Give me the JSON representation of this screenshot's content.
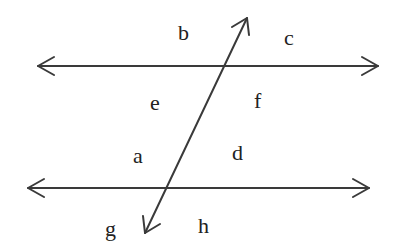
{
  "diagram": {
    "colors": {
      "line": "#3a3a3a",
      "text": "#222222",
      "background": "#ffffff"
    },
    "lines": {
      "top_parallel": {
        "x1": 38,
        "y1": 66,
        "x2": 378,
        "y2": 66,
        "arrows": "both"
      },
      "bottom_parallel": {
        "x1": 28,
        "y1": 188,
        "x2": 369,
        "y2": 188,
        "arrows": "both"
      },
      "transversal": {
        "x1": 145,
        "y1": 233,
        "x2": 247,
        "y2": 18,
        "arrows": "both"
      }
    },
    "labels": {
      "b": "b",
      "c": "c",
      "e": "e",
      "f": "f",
      "a": "a",
      "d": "d",
      "g": "g",
      "h": "h"
    }
  }
}
